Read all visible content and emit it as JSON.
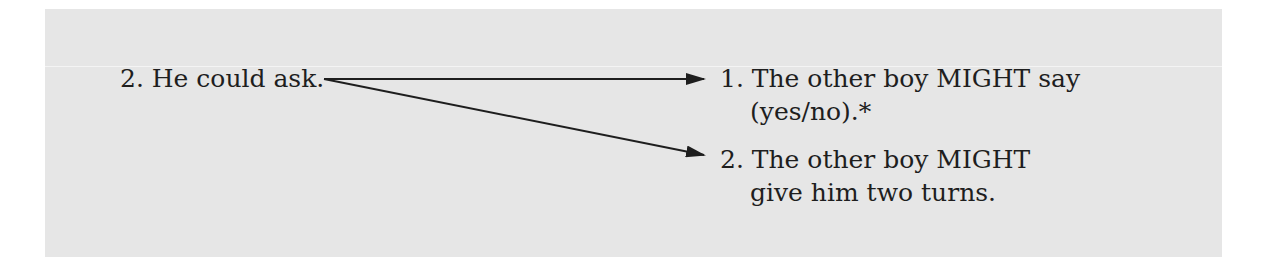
{
  "source": {
    "label": "2.",
    "text": "He could ask."
  },
  "outcomes": [
    {
      "label": "1.",
      "line1": "The other boy MIGHT say",
      "line2": "(yes/no).*"
    },
    {
      "label": "2.",
      "line1": "The other boy MIGHT",
      "line2": "give him two turns."
    }
  ],
  "colors": {
    "panel": "#e6e6e6",
    "text": "#1e1e1e"
  }
}
